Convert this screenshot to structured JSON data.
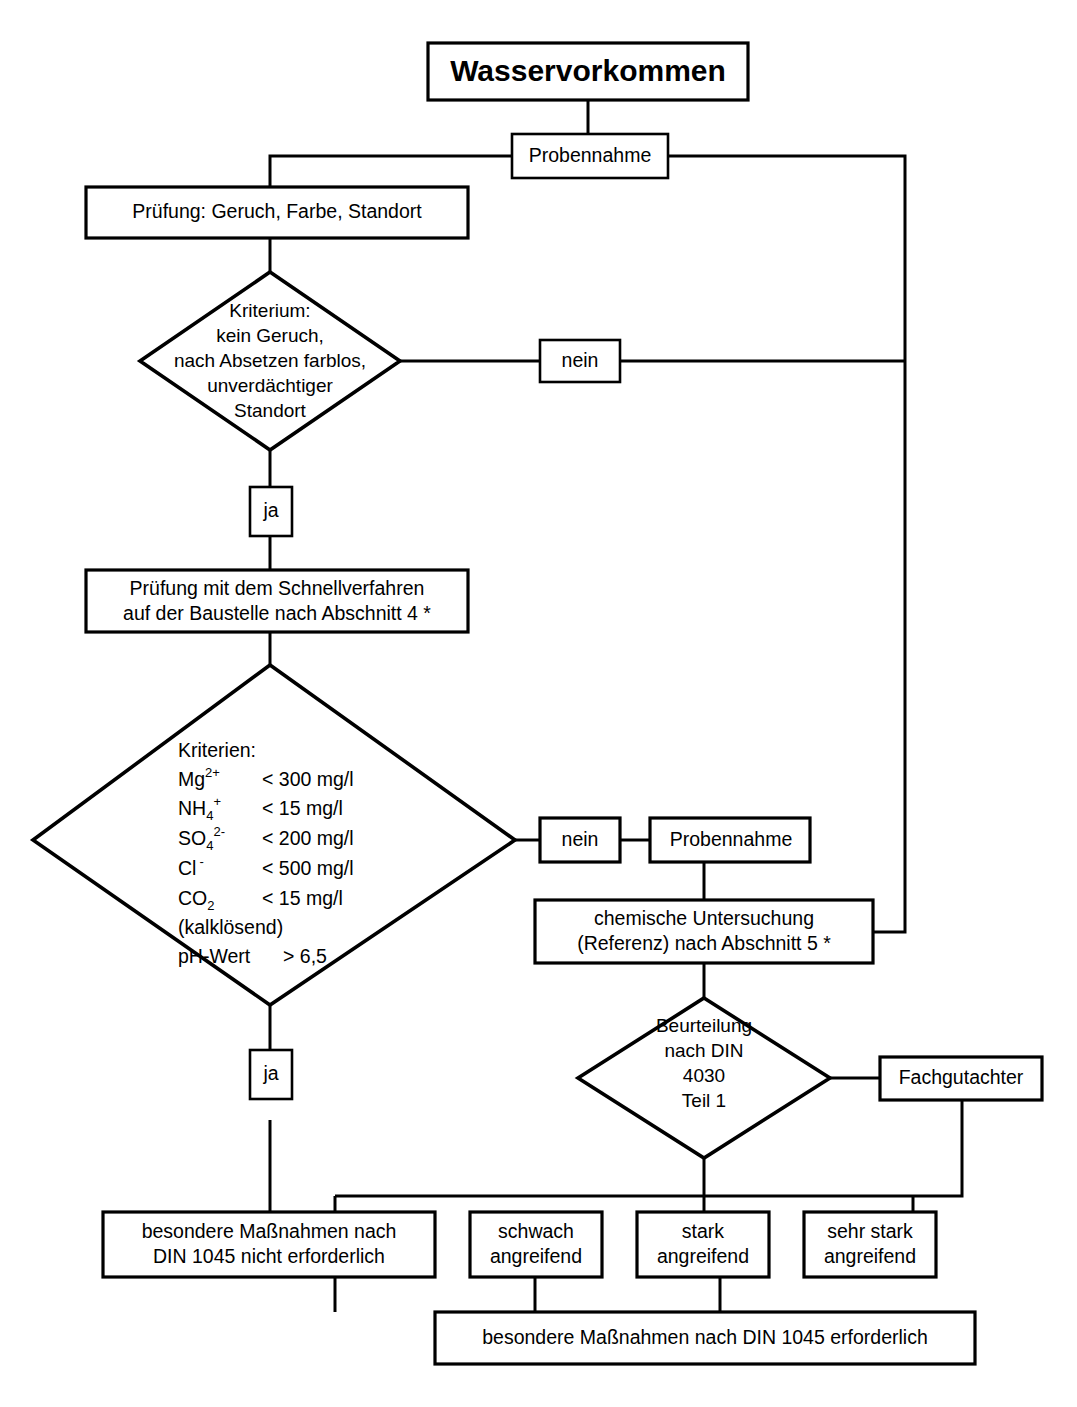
{
  "diagram": {
    "title": "Wasservorkommen",
    "language": "de",
    "nodes": {
      "title_box": {
        "label": "Wasservorkommen"
      },
      "probennahme_1": {
        "label": "Probennahme"
      },
      "pruefung_visual": {
        "label": "Prüfung: Geruch, Farbe, Standort"
      },
      "kriterium_diamond": {
        "lines": [
          "Kriterium:",
          "kein Geruch,",
          "nach Absetzen farblos,",
          "unverdächtiger",
          "Standort"
        ]
      },
      "nein_1": {
        "label": "nein"
      },
      "ja_1": {
        "label": "ja"
      },
      "schnellverfahren": {
        "lines": [
          "Prüfung mit dem Schnellverfahren",
          "auf der Baustelle nach  Abschnitt 4 *"
        ]
      },
      "kriterien_diamond": {
        "heading": "Kriterien:",
        "rows": [
          {
            "species": "Mg",
            "sup": "2+",
            "sub": "",
            "limit": "< 300 mg/l"
          },
          {
            "species": "NH",
            "sup": "+",
            "sub": "4",
            "limit": "<   15 mg/l"
          },
          {
            "species": "SO",
            "sup": "2-",
            "sub": "4",
            "limit": "< 200 mg/l"
          },
          {
            "species": "Cl",
            "sup": "-",
            "sub": "",
            "limit": "< 500 mg/l"
          },
          {
            "species": "CO",
            "sup": "",
            "sub": "2",
            "limit": "<   15 mg/l"
          }
        ],
        "note": "(kalklösend)",
        "ph_label": "pH-Wert",
        "ph_limit": "> 6,5"
      },
      "nein_2": {
        "label": "nein"
      },
      "ja_2": {
        "label": "ja"
      },
      "probennahme_2": {
        "label": "Probennahme"
      },
      "chemische_untersuchung": {
        "lines": [
          "chemische Untersuchung",
          "(Referenz) nach Abschnitt 5 *"
        ]
      },
      "beurteilung_diamond": {
        "lines": [
          "Beurteilung",
          "nach DIN",
          "4030",
          "Teil 1"
        ]
      },
      "fachgutachter": {
        "label": "Fachgutachter"
      },
      "result_no_measures": {
        "lines": [
          "besondere Maßnahmen nach",
          "DIN 1045 nicht erforderlich"
        ]
      },
      "result_schwach": {
        "lines": [
          "schwach",
          "angreifend"
        ]
      },
      "result_stark": {
        "lines": [
          "stark",
          "angreifend"
        ]
      },
      "result_sehr_stark": {
        "lines": [
          "sehr stark",
          "angreifend"
        ]
      },
      "result_measures_required": {
        "label": "besondere Maßnahmen nach DIN 1045 erforderlich"
      }
    },
    "colors": {
      "background": "#ffffff",
      "stroke": "#000000",
      "text": "#000000"
    }
  }
}
